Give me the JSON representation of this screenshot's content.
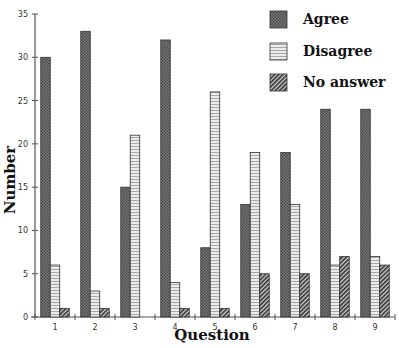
{
  "chart_data": {
    "type": "bar",
    "title": "",
    "xlabel": "Question",
    "ylabel": "Number",
    "categories": [
      "1",
      "2",
      "3",
      "4",
      "5",
      "6",
      "7",
      "8",
      "9"
    ],
    "series": [
      {
        "name": "Agree",
        "pattern": "crosshatch",
        "color": "#6a6a6a",
        "values": [
          30,
          33,
          15,
          32,
          8,
          13,
          19,
          24,
          24
        ]
      },
      {
        "name": "Disagree",
        "pattern": "horizontal-stripes",
        "color": "#dcdcdc",
        "values": [
          6,
          3,
          21,
          4,
          26,
          19,
          13,
          6,
          7
        ]
      },
      {
        "name": "No answer",
        "pattern": "diagonal-hatch",
        "color": "#3a3a3a",
        "values": [
          1,
          1,
          0,
          1,
          1,
          5,
          5,
          7,
          6
        ]
      }
    ],
    "ylim": [
      0,
      35
    ],
    "yticks": [
      0,
      5,
      10,
      15,
      20,
      25,
      30,
      35
    ],
    "grid": false,
    "legend_position": "top-right"
  }
}
